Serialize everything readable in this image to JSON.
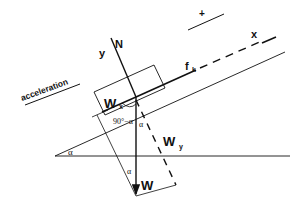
{
  "diagram": {
    "type": "free-body diagram on inclined plane",
    "labels": {
      "acceleration": "acceleration",
      "plus": "+",
      "x_axis": "x",
      "y_axis": "y",
      "normal": "N",
      "friction": "f",
      "friction_sub": "k",
      "weight": "W",
      "wx": "W",
      "wx_sub": "x",
      "wy": "W",
      "wy_sub": "y",
      "angle_complement": "90°−α",
      "alpha_incline": "α",
      "alpha_top": "α",
      "alpha_bottom": "α"
    },
    "colors": {
      "ink": "#111111",
      "background": "#ffffff"
    }
  }
}
